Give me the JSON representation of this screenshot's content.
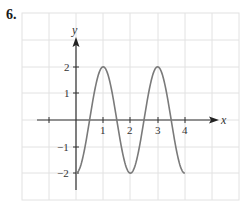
{
  "problem": {
    "number": "6."
  },
  "chart_data": {
    "type": "line",
    "title": "",
    "xlabel": "x",
    "ylabel": "y",
    "function_description": "y = -2cos(pi x)",
    "x_range_plotted": [
      0,
      4
    ],
    "xlim": [
      -2,
      6
    ],
    "ylim": [
      -3,
      4
    ],
    "x_ticks": [
      -1,
      1,
      2,
      3,
      4
    ],
    "x_tick_labels": [
      "",
      "1",
      "2",
      "3",
      "4"
    ],
    "y_ticks": [
      -2,
      -1,
      1,
      2
    ],
    "y_tick_labels": [
      "-2",
      "-1",
      "1",
      "2"
    ],
    "grid": true,
    "legend": null,
    "series": [
      {
        "name": "curve",
        "color": "#7a7a7a",
        "x": [
          0,
          0.25,
          0.5,
          0.75,
          1,
          1.25,
          1.5,
          1.75,
          2,
          2.25,
          2.5,
          2.75,
          3,
          3.25,
          3.5,
          3.75,
          4
        ],
        "y": [
          -2,
          -1.41,
          0,
          1.41,
          2,
          1.41,
          0,
          -1.41,
          -2,
          -1.41,
          0,
          1.41,
          2,
          1.41,
          0,
          -1.41,
          -2
        ]
      }
    ],
    "key_points": [
      {
        "x": 0,
        "y": -2
      },
      {
        "x": 1,
        "y": 2
      },
      {
        "x": 2,
        "y": -2
      },
      {
        "x": 3,
        "y": 2
      },
      {
        "x": 4,
        "y": -2
      }
    ]
  },
  "labels": {
    "x_axis": "x",
    "y_axis": "y",
    "x1": "1",
    "x2": "2",
    "x3": "3",
    "x4": "4",
    "y2": "2",
    "y1": "1",
    "ym1": "−1",
    "ym2": "−2"
  },
  "colors": {
    "grid": "#e2e2e2",
    "axis": "#333333",
    "curve": "#7a7a7a"
  }
}
